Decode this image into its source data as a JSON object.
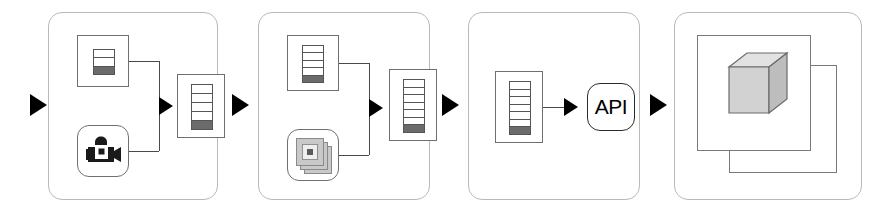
{
  "diagram": {
    "type": "flow-diagram",
    "width": 885,
    "height": 211,
    "background_color": "#ffffff",
    "panel_border_color": "#b9b9b9",
    "arrow_color": "#000000",
    "icon_line_color": "#555555",
    "icon_fill_dark": "#6b6b6b"
  },
  "arrows": [
    {
      "name": "input-arrow",
      "label": ""
    },
    {
      "name": "stage1-to-stage2-arrow",
      "label": ""
    },
    {
      "name": "stage2-to-stage3-arrow",
      "label": ""
    },
    {
      "name": "stage3-to-stage4-arrow",
      "label": ""
    }
  ],
  "stages": [
    {
      "id": "stage-1",
      "label": "",
      "nodes": [
        {
          "name": "metadata-list-icon",
          "kind": "list-icon",
          "rows": 3,
          "dark_rows": 1,
          "label": ""
        },
        {
          "name": "video-camera-icon",
          "kind": "camera-icon",
          "label": ""
        },
        {
          "name": "result-list-icon",
          "kind": "list-icon",
          "rows": 5,
          "dark_rows": 1,
          "label": ""
        }
      ]
    },
    {
      "id": "stage-2",
      "label": "",
      "nodes": [
        {
          "name": "metadata-list-icon",
          "kind": "list-icon",
          "rows": 5,
          "dark_rows": 1,
          "label": ""
        },
        {
          "name": "image-stack-icon",
          "kind": "stack-icon",
          "label": ""
        },
        {
          "name": "result-list-icon",
          "kind": "list-icon",
          "rows": 7,
          "dark_rows": 1,
          "label": ""
        }
      ]
    },
    {
      "id": "stage-3",
      "label": "",
      "nodes": [
        {
          "name": "source-list-icon",
          "kind": "list-icon",
          "rows": 7,
          "dark_rows": 1,
          "label": ""
        },
        {
          "name": "api-box",
          "kind": "api-box",
          "label": "API"
        }
      ]
    },
    {
      "id": "stage-4",
      "label": "",
      "nodes": [
        {
          "name": "back-layer-frame",
          "kind": "frame",
          "label": ""
        },
        {
          "name": "front-layer-frame",
          "kind": "frame",
          "label": ""
        },
        {
          "name": "cube-icon",
          "kind": "cube-icon",
          "label": ""
        }
      ]
    }
  ]
}
